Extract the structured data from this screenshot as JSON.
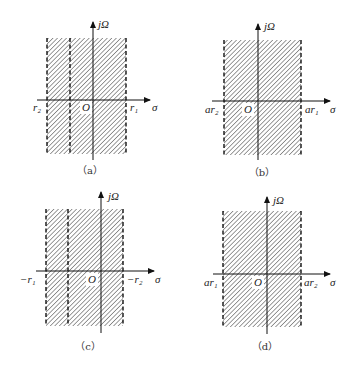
{
  "figure": {
    "axis_labels": {
      "vertical": "jΩ",
      "horizontal": "σ",
      "origin": "O"
    },
    "colors": {
      "hatch": "#555555",
      "axis": "#111111",
      "dashed": "#111111"
    },
    "panels": [
      {
        "caption": "（a）",
        "left_label": "r₂",
        "right_label": "r₁",
        "region": {
          "x0": 47,
          "x1": 126,
          "y0": 38,
          "y1": 154
        },
        "dashed_x": [
          47,
          70,
          126
        ],
        "axis_x": 93,
        "axis_y": 100,
        "axis_top": 22,
        "axis_bottom": 160,
        "haxis_x0": 37,
        "haxis_x1": 150,
        "left_label_x": 33,
        "right_label_x": 130,
        "sigma_x": 152,
        "label_y": 111,
        "origin_x": 82,
        "origin_y": 111,
        "jw_x": 98,
        "jw_y": 28,
        "caption_x": 90,
        "caption_y": 174
      },
      {
        "caption": "（b）",
        "left_label": "ar₂",
        "right_label": "ar₁",
        "region": {
          "x0": 224,
          "x1": 301,
          "y0": 40,
          "y1": 155
        },
        "dashed_x": [
          224,
          301
        ],
        "axis_x": 258,
        "axis_y": 101,
        "axis_top": 24,
        "axis_bottom": 160,
        "haxis_x0": 212,
        "haxis_x1": 330,
        "left_label_x": 205,
        "right_label_x": 305,
        "sigma_x": 330,
        "label_y": 113,
        "origin_x": 244,
        "origin_y": 113,
        "jw_x": 264,
        "jw_y": 30,
        "caption_x": 262,
        "caption_y": 176
      },
      {
        "caption": "（c）",
        "left_label": "−r₁",
        "right_label": "−r₂",
        "region": {
          "x0": 46,
          "x1": 123,
          "y0": 209,
          "y1": 326
        },
        "dashed_x": [
          46,
          68,
          123
        ],
        "axis_x": 101,
        "axis_y": 271,
        "axis_top": 192,
        "axis_bottom": 333,
        "haxis_x0": 36,
        "haxis_x1": 154,
        "left_label_x": 20,
        "right_label_x": 127,
        "sigma_x": 155,
        "label_y": 283,
        "origin_x": 88,
        "origin_y": 283,
        "jw_x": 108,
        "jw_y": 200,
        "caption_x": 88,
        "caption_y": 350
      },
      {
        "caption": "（d）",
        "left_label": "ar₁",
        "right_label": "ar₂",
        "region": {
          "x0": 223,
          "x1": 301,
          "y0": 211,
          "y1": 327
        },
        "dashed_x": [
          223,
          301
        ],
        "axis_x": 267,
        "axis_y": 274,
        "axis_top": 197,
        "axis_bottom": 334,
        "haxis_x0": 213,
        "haxis_x1": 330,
        "left_label_x": 204,
        "right_label_x": 304,
        "sigma_x": 330,
        "label_y": 286,
        "origin_x": 254,
        "origin_y": 286,
        "jw_x": 273,
        "jw_y": 204,
        "caption_x": 265,
        "caption_y": 350
      }
    ]
  }
}
